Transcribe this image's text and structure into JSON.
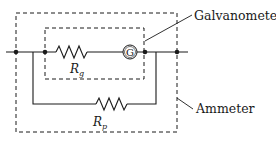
{
  "diagram": {
    "type": "circuit",
    "labels": {
      "galvanometer": "Galvanometer",
      "ammeter": "Ammeter",
      "rg_main": "R",
      "rg_sub": "g",
      "rp_main": "R",
      "rp_sub": "p",
      "g_symbol": "G"
    },
    "components": [
      {
        "id": "Rg",
        "kind": "resistor",
        "label": "Rg",
        "branch": "series with galvanometer"
      },
      {
        "id": "G",
        "kind": "galvanometer",
        "label": "G"
      },
      {
        "id": "Rp",
        "kind": "resistor",
        "label": "Rp",
        "branch": "parallel shunt"
      }
    ],
    "groups": [
      {
        "id": "galvanometer-box",
        "label": "Galvanometer",
        "contains": [
          "Rg",
          "G"
        ],
        "style": "dashed"
      },
      {
        "id": "ammeter-box",
        "label": "Ammeter",
        "contains": [
          "galvanometer-box",
          "Rp"
        ],
        "style": "dashed"
      }
    ],
    "colors": {
      "line": "#1a1a1a",
      "background": "#ffffff"
    }
  }
}
